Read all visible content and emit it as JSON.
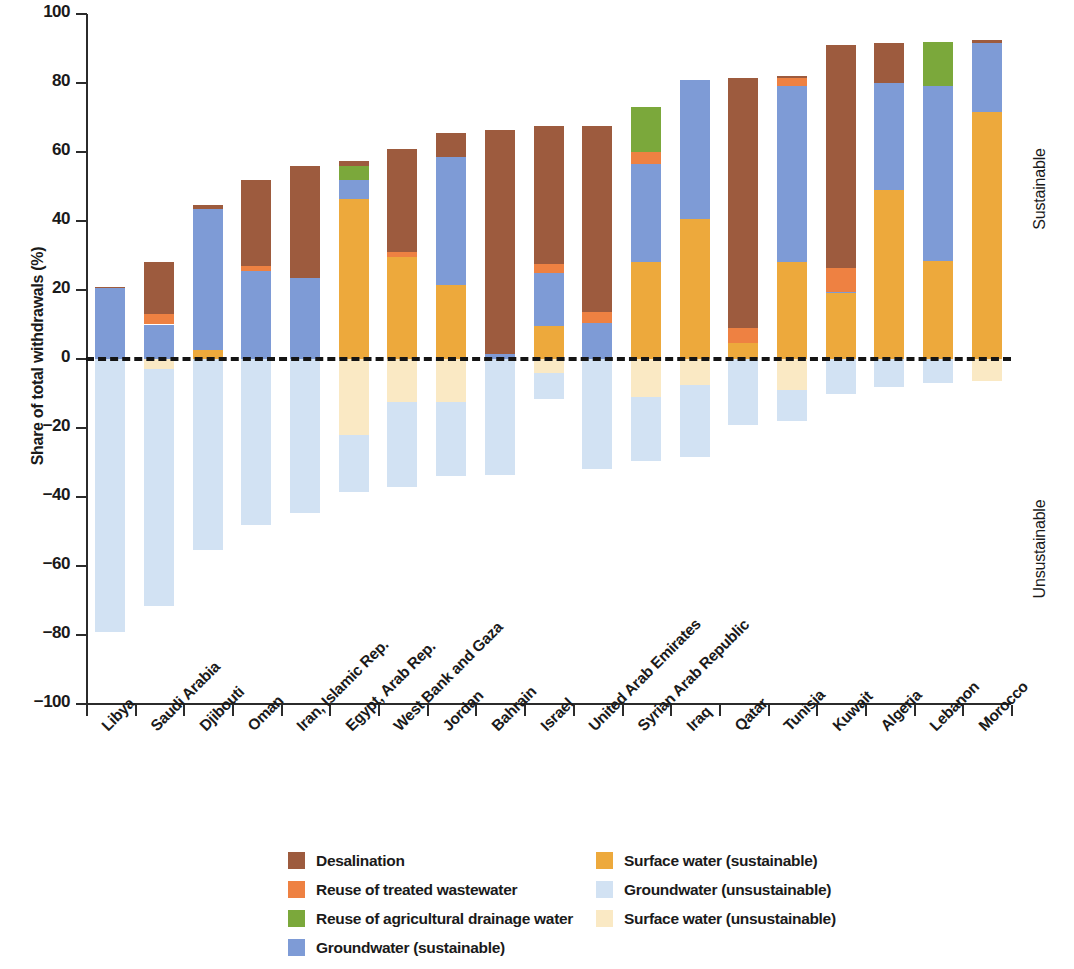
{
  "chart_data": {
    "type": "bar",
    "subtype": "stacked-diverging",
    "title": "",
    "xlabel": "",
    "ylabel": "Share of total withdrawals (%)",
    "ylim": [
      -100,
      100
    ],
    "yticks": [
      100,
      80,
      60,
      40,
      20,
      0,
      -20,
      -40,
      -60,
      -80,
      -100
    ],
    "ytick_labels": [
      "100",
      "80",
      "60",
      "40",
      "20",
      "0",
      "−20",
      "−40",
      "−60",
      "−80",
      "−100"
    ],
    "grid": false,
    "legend_position": "bottom",
    "zero_reference_line": true,
    "side_annotations": [
      {
        "label": "Sustainable",
        "region": "positive"
      },
      {
        "label": "Unsustainable",
        "region": "negative"
      }
    ],
    "categories": [
      "Libya",
      "Saudi Arabia",
      "Djibouti",
      "Oman",
      "Iran, Islamic Rep.",
      "Egypt, Arab Rep.",
      "West Bank and Gaza",
      "Jordan",
      "Bahrain",
      "Israel",
      "United Arab Emirates",
      "Syrian Arab Republic",
      "Iraq",
      "Qatar",
      "Tunisia",
      "Kuwait",
      "Algeria",
      "Lebanon",
      "Morocco"
    ],
    "series": [
      {
        "name": "Surface water (sustainable)",
        "key": "surface_sustainable",
        "color": "#EDA93C",
        "sign": "positive",
        "values": [
          0,
          0,
          2.5,
          0,
          0,
          46.5,
          29.5,
          21.5,
          0,
          9.5,
          0,
          28,
          40.5,
          4.5,
          28,
          19,
          49,
          28.5,
          71.5
        ]
      },
      {
        "name": "Groundwater (sustainable)",
        "key": "groundwater_sustainable",
        "color": "#7E9BD6",
        "sign": "positive",
        "values": [
          20.5,
          10,
          41,
          25.5,
          23.5,
          5.5,
          0,
          37,
          1.5,
          15.5,
          10.5,
          28.5,
          40.5,
          0,
          51,
          0.5,
          31,
          50.5,
          20
        ]
      },
      {
        "name": "Reuse of treated wastewater",
        "key": "reuse_wastewater",
        "color": "#EE8142",
        "sign": "positive",
        "values": [
          0,
          3,
          0,
          1.5,
          0,
          0,
          1.5,
          0,
          0,
          2.5,
          3,
          3.5,
          0,
          4.5,
          2.5,
          7,
          0,
          0,
          0
        ]
      },
      {
        "name": "Reuse of agricultural drainage water",
        "key": "reuse_drainage",
        "color": "#7BA83B",
        "sign": "positive",
        "values": [
          0,
          0,
          0,
          0,
          0,
          4,
          0,
          0,
          0,
          0,
          0,
          13,
          0,
          0,
          0,
          0,
          0,
          13,
          0
        ]
      },
      {
        "name": "Desalination",
        "key": "desalination",
        "color": "#9D5B3E",
        "sign": "positive",
        "values": [
          0.5,
          15,
          1,
          25,
          32.5,
          1.5,
          30,
          7,
          65,
          40,
          54,
          0,
          0,
          72.5,
          0.5,
          64.5,
          11.5,
          0,
          1
        ]
      },
      {
        "name": "Surface water (unsustainable)",
        "key": "surface_unsustainable",
        "color": "#FAE9C4",
        "sign": "negative",
        "values": [
          0,
          3,
          0,
          0,
          0,
          22,
          12.5,
          12.5,
          0,
          4,
          0,
          11,
          7.5,
          0,
          9,
          0,
          0,
          0,
          6.5
        ]
      },
      {
        "name": "Groundwater (unsustainable)",
        "key": "groundwater_unsustainable",
        "color": "#D2E2F3",
        "sign": "negative",
        "values": [
          79,
          68.5,
          55.5,
          48,
          44.5,
          16.5,
          24.5,
          21.5,
          33.5,
          7.5,
          32,
          18.5,
          21,
          19,
          9,
          10,
          8,
          7,
          0
        ]
      }
    ],
    "stack_order_positive": [
      "surface_sustainable",
      "groundwater_sustainable",
      "reuse_wastewater",
      "reuse_drainage",
      "desalination"
    ],
    "stack_order_negative": [
      "surface_unsustainable",
      "groundwater_unsustainable"
    ],
    "totals_positive": [
      21,
      28,
      44.5,
      52,
      56,
      57.5,
      61,
      65.5,
      66.5,
      67.5,
      67.5,
      73,
      81,
      81.5,
      82,
      91,
      91.5,
      92,
      92.5
    ],
    "totals_negative": [
      -79,
      -71.5,
      -55.5,
      -48,
      -44.5,
      -38.5,
      -37,
      -34,
      -33.5,
      -11.5,
      -32,
      -29.5,
      -28.5,
      -19,
      -18,
      -10,
      -8,
      -7,
      -6.5
    ]
  },
  "legend": {
    "column_left": [
      {
        "label": "Desalination",
        "color": "#9D5B3E"
      },
      {
        "label": "Reuse of treated wastewater",
        "color": "#EE8142"
      },
      {
        "label": "Reuse of agricultural drainage water",
        "color": "#7BA83B"
      },
      {
        "label": "Groundwater (sustainable)",
        "color": "#7E9BD6"
      }
    ],
    "column_right": [
      {
        "label": "Surface water (sustainable)",
        "color": "#EDA93C"
      },
      {
        "label": "Groundwater (unsustainable)",
        "color": "#D2E2F3"
      },
      {
        "label": "Surface water (unsustainable)",
        "color": "#FAE9C4"
      }
    ]
  }
}
